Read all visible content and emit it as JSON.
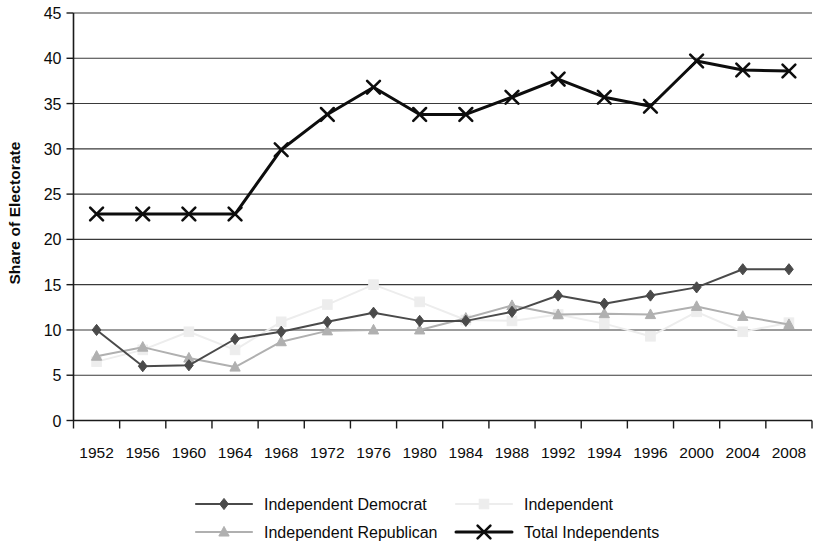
{
  "chart_data": {
    "type": "line",
    "title": "",
    "xlabel": "",
    "ylabel": "Share of Electorate",
    "ylim": [
      0,
      45
    ],
    "ytick_step": 5,
    "yticks": [
      "0",
      "5",
      "10",
      "15",
      "20",
      "25",
      "30",
      "35",
      "40",
      "45"
    ],
    "grid": "horizontal",
    "legend_position": "bottom",
    "categories": [
      "1952",
      "1956",
      "1960",
      "1964",
      "1968",
      "1972",
      "1976",
      "1980",
      "1984",
      "1988",
      "1992",
      "1994",
      "1996",
      "2000",
      "2004",
      "2008"
    ],
    "series": [
      {
        "name": "Independent Democrat",
        "color": "#4a4a4a",
        "marker": "diamond",
        "values": [
          10.0,
          6.0,
          6.1,
          9.0,
          9.8,
          10.9,
          11.9,
          11.0,
          11.0,
          12.0,
          13.8,
          12.9,
          13.8,
          14.7,
          16.7,
          16.7
        ]
      },
      {
        "name": "Independent",
        "color": "#ededed",
        "marker": "square",
        "values": [
          6.5,
          7.8,
          9.8,
          7.8,
          10.9,
          12.8,
          15.0,
          13.1,
          11.1,
          11.0,
          11.7,
          10.7,
          9.3,
          12.0,
          9.8,
          10.8
        ]
      },
      {
        "name": "Independent Republican",
        "color": "#b0b0b0",
        "marker": "triangle",
        "values": [
          7.1,
          8.1,
          6.9,
          5.9,
          8.7,
          9.9,
          10.0,
          10.0,
          11.3,
          12.7,
          11.7,
          11.8,
          11.7,
          12.6,
          11.5,
          10.6
        ]
      },
      {
        "name": "Total Independents",
        "color": "#0d0d0d",
        "marker": "x",
        "values": [
          22.8,
          22.8,
          22.8,
          22.8,
          29.9,
          33.8,
          36.8,
          33.8,
          33.8,
          35.7,
          37.7,
          35.7,
          34.7,
          39.7,
          38.7,
          38.6
        ]
      }
    ],
    "legend": [
      {
        "label": "Independent Democrat",
        "color": "#4a4a4a",
        "marker": "diamond"
      },
      {
        "label": "Independent",
        "color": "#ededed",
        "marker": "square"
      },
      {
        "label": "Independent Republican",
        "color": "#b0b0b0",
        "marker": "triangle"
      },
      {
        "label": "Total Independents",
        "color": "#0d0d0d",
        "marker": "x"
      }
    ]
  }
}
